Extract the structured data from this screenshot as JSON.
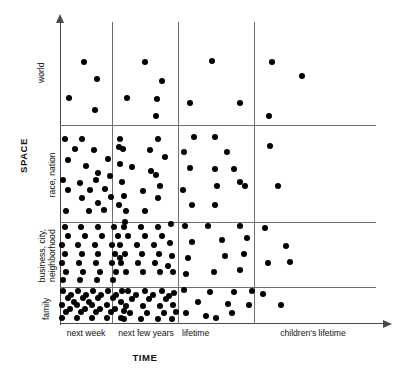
{
  "figure": {
    "type": "scatter-density-matrix"
  },
  "axes": {
    "y": {
      "title": "SPACE",
      "bands": [
        {
          "key": "world",
          "label": "world",
          "lines": [
            "world"
          ]
        },
        {
          "key": "race-nation",
          "label": "race, nation",
          "lines": [
            "race, nation"
          ]
        },
        {
          "key": "business-city-neighborhood",
          "label": "business, city, neighborhood",
          "lines": [
            "business, city,",
            "neighborhood"
          ]
        },
        {
          "key": "family",
          "label": "family",
          "lines": [
            "family"
          ]
        }
      ]
    },
    "x": {
      "title": "TIME",
      "columns": [
        {
          "key": "next-week",
          "label": "next week"
        },
        {
          "key": "next-few-years",
          "label": "next few years"
        },
        {
          "key": "lifetime",
          "label": "lifetime"
        },
        {
          "key": "childrens-lifetime",
          "label": "children's lifetime"
        }
      ]
    }
  },
  "colors": {
    "dot": "#000000",
    "gridline": "#6e6e6e",
    "axis": "#4a4a4a",
    "background": "#ffffff",
    "text": "#111111"
  },
  "chart_data": {
    "type": "scatter",
    "title": "",
    "xlabel": "TIME",
    "ylabel": "SPACE",
    "grid": true,
    "legend": "none",
    "x_categories": [
      "next week",
      "next few years",
      "lifetime",
      "children's lifetime"
    ],
    "y_categories": [
      "family",
      "business, city, neighborhood",
      "race, nation",
      "world"
    ],
    "cell_counts": [
      {
        "space": "world",
        "time": "next week",
        "count": 4
      },
      {
        "space": "world",
        "time": "next few years",
        "count": 5
      },
      {
        "space": "world",
        "time": "lifetime",
        "count": 3
      },
      {
        "space": "world",
        "time": "children's lifetime",
        "count": 3
      },
      {
        "space": "race, nation",
        "time": "next week",
        "count": 22
      },
      {
        "space": "race, nation",
        "time": "next few years",
        "count": 14
      },
      {
        "space": "race, nation",
        "time": "lifetime",
        "count": 12
      },
      {
        "space": "race, nation",
        "time": "children's lifetime",
        "count": 3
      },
      {
        "space": "business, city, neighborhood",
        "time": "next week",
        "count": 30
      },
      {
        "space": "business, city, neighborhood",
        "time": "next few years",
        "count": 23
      },
      {
        "space": "business, city, neighborhood",
        "time": "lifetime",
        "count": 12
      },
      {
        "space": "business, city, neighborhood",
        "time": "children's lifetime",
        "count": 4
      },
      {
        "space": "family",
        "time": "next week",
        "count": 34
      },
      {
        "space": "family",
        "time": "next few years",
        "count": 22
      },
      {
        "space": "family",
        "time": "lifetime",
        "count": 11
      },
      {
        "space": "family",
        "time": "children's lifetime",
        "count": 2
      }
    ],
    "points": [
      [
        84,
        62
      ],
      [
        97,
        79
      ],
      [
        69,
        98
      ],
      [
        95,
        110
      ],
      [
        145,
        62
      ],
      [
        162,
        81
      ],
      [
        127,
        98
      ],
      [
        157,
        99
      ],
      [
        156,
        116
      ],
      [
        212,
        61
      ],
      [
        190,
        103
      ],
      [
        240,
        103
      ],
      [
        272,
        62
      ],
      [
        302,
        76
      ],
      [
        269,
        116
      ],
      [
        65,
        139
      ],
      [
        82,
        139
      ],
      [
        75,
        149
      ],
      [
        94,
        150
      ],
      [
        68,
        160
      ],
      [
        108,
        159
      ],
      [
        86,
        166
      ],
      [
        98,
        173
      ],
      [
        63,
        180
      ],
      [
        80,
        183
      ],
      [
        96,
        180
      ],
      [
        110,
        176
      ],
      [
        68,
        190
      ],
      [
        90,
        190
      ],
      [
        105,
        189
      ],
      [
        82,
        198
      ],
      [
        98,
        203
      ],
      [
        111,
        197
      ],
      [
        66,
        211
      ],
      [
        89,
        211
      ],
      [
        104,
        210
      ],
      [
        119,
        205
      ],
      [
        119,
        147
      ],
      [
        120,
        139
      ],
      [
        158,
        139
      ],
      [
        123,
        149
      ],
      [
        150,
        150
      ],
      [
        120,
        164
      ],
      [
        165,
        157
      ],
      [
        132,
        167
      ],
      [
        151,
        171
      ],
      [
        122,
        182
      ],
      [
        156,
        175
      ],
      [
        124,
        196
      ],
      [
        143,
        191
      ],
      [
        160,
        186
      ],
      [
        126,
        211
      ],
      [
        145,
        211
      ],
      [
        158,
        198
      ],
      [
        194,
        137
      ],
      [
        215,
        137
      ],
      [
        184,
        152
      ],
      [
        227,
        152
      ],
      [
        190,
        168
      ],
      [
        215,
        169
      ],
      [
        234,
        169
      ],
      [
        183,
        190
      ],
      [
        217,
        186
      ],
      [
        240,
        182
      ],
      [
        192,
        205
      ],
      [
        215,
        205
      ],
      [
        270,
        146
      ],
      [
        245,
        186
      ],
      [
        278,
        186
      ],
      [
        65,
        227
      ],
      [
        81,
        227
      ],
      [
        98,
        227
      ],
      [
        114,
        227
      ],
      [
        125,
        222
      ],
      [
        68,
        236
      ],
      [
        85,
        236
      ],
      [
        102,
        236
      ],
      [
        118,
        236
      ],
      [
        62,
        245
      ],
      [
        78,
        245
      ],
      [
        95,
        245
      ],
      [
        112,
        245
      ],
      [
        65,
        254
      ],
      [
        82,
        254
      ],
      [
        98,
        254
      ],
      [
        115,
        254
      ],
      [
        62,
        263
      ],
      [
        79,
        263
      ],
      [
        96,
        263
      ],
      [
        112,
        263
      ],
      [
        66,
        272
      ],
      [
        83,
        272
      ],
      [
        100,
        272
      ],
      [
        116,
        272
      ],
      [
        63,
        280
      ],
      [
        80,
        280
      ],
      [
        97,
        280
      ],
      [
        113,
        280
      ],
      [
        120,
        258
      ],
      [
        124,
        227
      ],
      [
        141,
        227
      ],
      [
        158,
        227
      ],
      [
        171,
        224
      ],
      [
        128,
        236
      ],
      [
        145,
        236
      ],
      [
        162,
        236
      ],
      [
        120,
        245
      ],
      [
        137,
        245
      ],
      [
        154,
        245
      ],
      [
        170,
        243
      ],
      [
        125,
        254
      ],
      [
        142,
        254
      ],
      [
        159,
        254
      ],
      [
        172,
        256
      ],
      [
        121,
        263
      ],
      [
        138,
        263
      ],
      [
        155,
        263
      ],
      [
        168,
        266
      ],
      [
        126,
        272
      ],
      [
        143,
        272
      ],
      [
        160,
        272
      ],
      [
        173,
        272
      ],
      [
        185,
        226
      ],
      [
        208,
        226
      ],
      [
        240,
        226
      ],
      [
        192,
        242
      ],
      [
        222,
        240
      ],
      [
        247,
        238
      ],
      [
        188,
        258
      ],
      [
        225,
        256
      ],
      [
        244,
        254
      ],
      [
        186,
        274
      ],
      [
        214,
        272
      ],
      [
        240,
        270
      ],
      [
        265,
        228
      ],
      [
        286,
        246
      ],
      [
        268,
        263
      ],
      [
        290,
        262
      ],
      [
        63,
        291
      ],
      [
        78,
        291
      ],
      [
        93,
        291
      ],
      [
        108,
        291
      ],
      [
        122,
        291
      ],
      [
        68,
        298
      ],
      [
        83,
        298
      ],
      [
        98,
        298
      ],
      [
        113,
        298
      ],
      [
        62,
        305
      ],
      [
        77,
        305
      ],
      [
        92,
        305
      ],
      [
        107,
        305
      ],
      [
        121,
        302
      ],
      [
        66,
        312
      ],
      [
        81,
        312
      ],
      [
        96,
        312
      ],
      [
        111,
        312
      ],
      [
        124,
        311
      ],
      [
        62,
        318
      ],
      [
        77,
        318
      ],
      [
        92,
        318
      ],
      [
        107,
        318
      ],
      [
        121,
        318
      ],
      [
        71,
        295
      ],
      [
        86,
        295
      ],
      [
        101,
        295
      ],
      [
        116,
        295
      ],
      [
        70,
        309
      ],
      [
        85,
        309
      ],
      [
        100,
        309
      ],
      [
        115,
        309
      ],
      [
        74,
        302
      ],
      [
        89,
        302
      ],
      [
        128,
        291
      ],
      [
        145,
        291
      ],
      [
        162,
        291
      ],
      [
        174,
        293
      ],
      [
        132,
        299
      ],
      [
        149,
        299
      ],
      [
        166,
        299
      ],
      [
        126,
        306
      ],
      [
        143,
        306
      ],
      [
        160,
        306
      ],
      [
        173,
        305
      ],
      [
        130,
        313
      ],
      [
        147,
        313
      ],
      [
        164,
        313
      ],
      [
        176,
        312
      ],
      [
        124,
        319
      ],
      [
        141,
        319
      ],
      [
        158,
        319
      ],
      [
        172,
        319
      ],
      [
        136,
        295
      ],
      [
        153,
        295
      ],
      [
        169,
        296
      ],
      [
        184,
        290
      ],
      [
        210,
        292
      ],
      [
        234,
        292
      ],
      [
        252,
        291
      ],
      [
        198,
        302
      ],
      [
        228,
        304
      ],
      [
        186,
        313
      ],
      [
        206,
        316
      ],
      [
        232,
        313
      ],
      [
        249,
        305
      ],
      [
        216,
        318
      ],
      [
        263,
        294
      ],
      [
        281,
        305
      ]
    ]
  }
}
